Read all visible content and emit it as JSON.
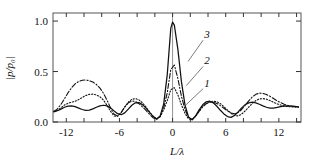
{
  "chart_data": {
    "type": "line",
    "title": "",
    "xlabel": "L/λ",
    "ylabel": "|p/p₀|",
    "xlim": [
      -13.5,
      14.5
    ],
    "ylim": [
      0.0,
      1.08
    ],
    "grid": false,
    "legend_position": "inline-annotations",
    "xticks": [
      -12,
      -6,
      0,
      6,
      12
    ],
    "xticklabels": [
      "-12",
      "-6",
      "0",
      "6",
      "12"
    ],
    "xminorticks": [
      -12,
      -10,
      -8,
      -6,
      -4,
      -2,
      0,
      2,
      4,
      6,
      8,
      10,
      12,
      14
    ],
    "yticks": [
      0.0,
      0.5,
      1.0
    ],
    "yticklabels": [
      "0.0",
      "0.5",
      "1.0"
    ],
    "zero_reference_line": 0,
    "annotations": [
      {
        "label": "3",
        "x": 3.9,
        "y": 0.86
      },
      {
        "label": "2",
        "x": 3.9,
        "y": 0.6
      },
      {
        "label": "1",
        "x": 3.9,
        "y": 0.38
      }
    ],
    "series": [
      {
        "name": "1",
        "label": "1",
        "style": "dotted",
        "peak": 0.35,
        "x": [
          -13.4,
          -13.0,
          -12.6,
          -12.2,
          -11.8,
          -11.4,
          -11.0,
          -10.6,
          -10.2,
          -9.8,
          -9.4,
          -9.0,
          -8.6,
          -8.2,
          -7.8,
          -7.4,
          -7.0,
          -6.6,
          -6.2,
          -5.8,
          -5.4,
          -5.0,
          -4.6,
          -4.2,
          -3.8,
          -3.4,
          -3.0,
          -2.6,
          -2.2,
          -1.8,
          -1.4,
          -1.0,
          -0.6,
          -0.2,
          0.2,
          0.6,
          1.0,
          1.4,
          1.8,
          2.2,
          2.6,
          3.0,
          3.4,
          3.8,
          4.2,
          4.6,
          5.0,
          5.4,
          5.8,
          6.2,
          6.6,
          7.0,
          7.4,
          7.8,
          8.2,
          8.6,
          9.0,
          9.4,
          9.8,
          10.2,
          10.6,
          11.0,
          11.4,
          11.8,
          12.2,
          12.6,
          13.0,
          13.4,
          13.8,
          14.2
        ],
        "y": [
          0.105,
          0.115,
          0.14,
          0.168,
          0.186,
          0.196,
          0.206,
          0.222,
          0.243,
          0.263,
          0.274,
          0.276,
          0.268,
          0.25,
          0.216,
          0.165,
          0.106,
          0.06,
          0.056,
          0.095,
          0.15,
          0.196,
          0.224,
          0.232,
          0.22,
          0.19,
          0.148,
          0.1,
          0.056,
          0.03,
          0.052,
          0.12,
          0.212,
          0.32,
          0.34,
          0.268,
          0.17,
          0.086,
          0.032,
          0.022,
          0.056,
          0.106,
          0.15,
          0.182,
          0.2,
          0.206,
          0.2,
          0.182,
          0.152,
          0.118,
          0.086,
          0.064,
          0.06,
          0.078,
          0.11,
          0.148,
          0.184,
          0.212,
          0.228,
          0.232,
          0.226,
          0.212,
          0.196,
          0.18,
          0.168,
          0.16,
          0.154,
          0.15,
          0.148,
          0.147
        ]
      },
      {
        "name": "2",
        "label": "2",
        "style": "dash-dot",
        "peak": 0.57,
        "x": [
          -13.4,
          -13.0,
          -12.6,
          -12.2,
          -11.8,
          -11.4,
          -11.0,
          -10.6,
          -10.2,
          -9.8,
          -9.4,
          -9.0,
          -8.6,
          -8.2,
          -7.8,
          -7.4,
          -7.0,
          -6.6,
          -6.2,
          -5.8,
          -5.4,
          -5.0,
          -4.6,
          -4.2,
          -3.8,
          -3.4,
          -3.0,
          -2.6,
          -2.2,
          -1.8,
          -1.4,
          -1.0,
          -0.6,
          -0.2,
          0.2,
          0.6,
          1.0,
          1.4,
          1.8,
          2.2,
          2.6,
          3.0,
          3.4,
          3.8,
          4.2,
          4.6,
          5.0,
          5.4,
          5.8,
          6.2,
          6.6,
          7.0,
          7.4,
          7.8,
          8.2,
          8.6,
          9.0,
          9.4,
          9.8,
          10.2,
          10.6,
          11.0,
          11.4,
          11.8,
          12.2,
          12.6,
          13.0,
          13.4,
          13.8,
          14.2
        ],
        "y": [
          0.105,
          0.13,
          0.175,
          0.23,
          0.29,
          0.34,
          0.378,
          0.402,
          0.414,
          0.416,
          0.41,
          0.396,
          0.372,
          0.336,
          0.284,
          0.216,
          0.14,
          0.076,
          0.06,
          0.094,
          0.148,
          0.19,
          0.208,
          0.204,
          0.182,
          0.15,
          0.114,
          0.076,
          0.042,
          0.026,
          0.056,
          0.14,
          0.29,
          0.52,
          0.565,
          0.43,
          0.254,
          0.124,
          0.046,
          0.024,
          0.058,
          0.108,
          0.152,
          0.182,
          0.196,
          0.196,
          0.184,
          0.162,
          0.136,
          0.11,
          0.09,
          0.082,
          0.094,
          0.124,
          0.166,
          0.21,
          0.248,
          0.274,
          0.286,
          0.284,
          0.272,
          0.254,
          0.232,
          0.21,
          0.192,
          0.176,
          0.165,
          0.158,
          0.152,
          0.15
        ]
      },
      {
        "name": "3",
        "label": "3",
        "style": "solid",
        "peak": 1.0,
        "x": [
          -13.4,
          -13.0,
          -12.6,
          -12.2,
          -11.8,
          -11.4,
          -11.0,
          -10.6,
          -10.2,
          -9.8,
          -9.4,
          -9.0,
          -8.6,
          -8.2,
          -7.8,
          -7.4,
          -7.0,
          -6.6,
          -6.2,
          -5.8,
          -5.4,
          -5.0,
          -4.6,
          -4.2,
          -3.8,
          -3.4,
          -3.0,
          -2.6,
          -2.2,
          -1.8,
          -1.4,
          -1.0,
          -0.6,
          -0.2,
          0.0,
          0.2,
          0.6,
          1.0,
          1.4,
          1.8,
          2.2,
          2.6,
          3.0,
          3.4,
          3.8,
          4.2,
          4.6,
          5.0,
          5.4,
          5.8,
          6.2,
          6.6,
          7.0,
          7.4,
          7.8,
          8.2,
          8.6,
          9.0,
          9.4,
          9.8,
          10.2,
          10.6,
          11.0,
          11.4,
          11.8,
          12.2,
          12.6,
          13.0,
          13.4,
          13.8,
          14.2
        ],
        "y": [
          0.1,
          0.112,
          0.128,
          0.146,
          0.158,
          0.16,
          0.152,
          0.138,
          0.124,
          0.116,
          0.118,
          0.13,
          0.146,
          0.16,
          0.166,
          0.16,
          0.14,
          0.11,
          0.082,
          0.072,
          0.09,
          0.128,
          0.166,
          0.19,
          0.192,
          0.172,
          0.138,
          0.096,
          0.056,
          0.03,
          0.06,
          0.18,
          0.47,
          0.93,
          0.99,
          0.96,
          0.72,
          0.4,
          0.17,
          0.05,
          0.022,
          0.06,
          0.12,
          0.17,
          0.2,
          0.206,
          0.19,
          0.156,
          0.116,
          0.08,
          0.054,
          0.046,
          0.064,
          0.1,
          0.14,
          0.172,
          0.19,
          0.196,
          0.19,
          0.176,
          0.16,
          0.146,
          0.138,
          0.138,
          0.144,
          0.152,
          0.158,
          0.16,
          0.158,
          0.154,
          0.15
        ]
      }
    ]
  }
}
